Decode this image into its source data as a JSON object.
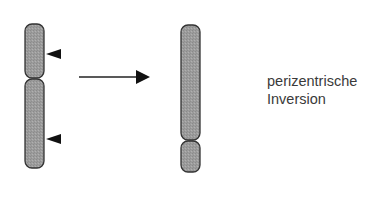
{
  "diagram": {
    "label_line1": "perizentrische",
    "label_line2": "Inversion",
    "colors": {
      "chromosome_fill": "#9c9c9c",
      "outline": "#333333",
      "marker": "#111111",
      "text": "#3a3a3a"
    },
    "before": {
      "description": "normal chromosome with two breakpoint markers",
      "icons": [
        "breakpoint-arrowhead",
        "breakpoint-arrowhead"
      ]
    },
    "transition": {
      "icon": "right-arrow"
    },
    "after": {
      "description": "chromosome after pericentric inversion"
    }
  }
}
